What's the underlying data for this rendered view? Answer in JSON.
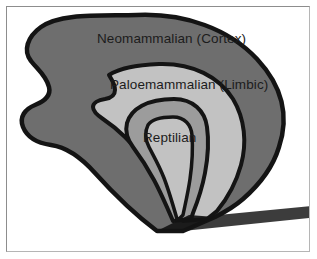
{
  "figure": {
    "background_color": "#ffffff",
    "frame_color": "#9a9a9a",
    "outline_color": "#141414",
    "label_text_color": "#1c1c1c"
  },
  "layers": [
    {
      "id": "neomammalian",
      "label": "Neomammalian (Cortex)",
      "fill_color": "#6e6e6e",
      "order": 1
    },
    {
      "id": "paleomammalian",
      "label": "Paloemammalian (Limbic)",
      "fill_color": "#c2c2c2",
      "order": 2
    },
    {
      "id": "reptilian",
      "label": "Reptilian",
      "fill_color": "#9c9c9c",
      "order": 3
    }
  ],
  "labels": {
    "neomammalian": "Neomammalian (Cortex)",
    "paleomammalian": "Paloemammalian (Limbic)",
    "reptilian": "Reptilian"
  }
}
